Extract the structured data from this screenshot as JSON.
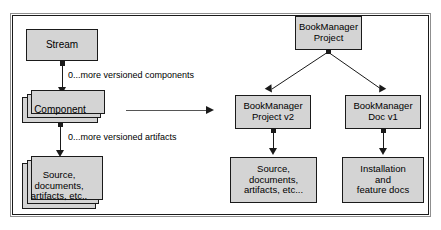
{
  "diagram": {
    "colors": {
      "node_fill": "#d4d4d4",
      "node_border": "#1a1a1a",
      "line": "#1a1a1a",
      "frame_outer": "#8f8f8f",
      "frame_inner": "#1a1a1a",
      "background": "#ffffff"
    },
    "left_panel": {
      "nodes": [
        {
          "id": "stream",
          "label": "Stream",
          "stacked": false
        },
        {
          "id": "component",
          "label": "Component",
          "stacked": true
        },
        {
          "id": "artifacts",
          "label": "Source,\ndocuments,\nartifacts, etc..",
          "stacked": true
        }
      ],
      "edges": [
        {
          "id": "stream-component",
          "from": "stream",
          "to": "component",
          "label": "0...more versioned components"
        },
        {
          "id": "component-artifacts",
          "from": "component",
          "to": "artifacts",
          "label": "0...more versioned artifacts"
        }
      ]
    },
    "middle": {
      "arrow": "maps-to-arrow"
    },
    "right_panel": {
      "nodes": [
        {
          "id": "bm-project",
          "label": "BookManager\nProject",
          "stacked": false
        },
        {
          "id": "bm-project-v2",
          "label": "BookManager\nProject v2",
          "stacked": false
        },
        {
          "id": "bm-doc-v1",
          "label": "BookManager\nDoc v1",
          "stacked": false
        },
        {
          "id": "bm-src",
          "label": "Source,\ndocuments,\nartifacts, etc...",
          "stacked": false
        },
        {
          "id": "bm-docs",
          "label": "Installation\nand\nfeature docs",
          "stacked": false
        }
      ],
      "edges": [
        {
          "id": "project-to-v2",
          "from": "bm-project",
          "to": "bm-project-v2",
          "label": ""
        },
        {
          "id": "project-to-doc",
          "from": "bm-project",
          "to": "bm-doc-v1",
          "label": ""
        },
        {
          "id": "v2-to-src",
          "from": "bm-project-v2",
          "to": "bm-src",
          "label": ""
        },
        {
          "id": "doc-to-docs",
          "from": "bm-doc-v1",
          "to": "bm-docs",
          "label": ""
        }
      ]
    }
  }
}
